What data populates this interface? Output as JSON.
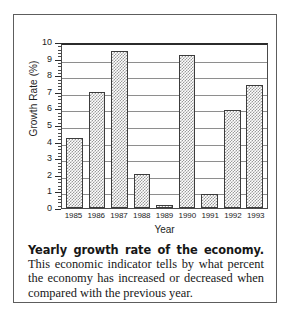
{
  "figure": {
    "caption_lead": "Yearly growth rate of the economy.",
    "caption_body": " This economic indicator tells by what percent the economy has increased or decreased when compared with the previous year."
  },
  "chart_data": {
    "type": "bar",
    "title": "",
    "xlabel": "Year",
    "ylabel": "Growth Rate (%)",
    "categories": [
      "1985",
      "1986",
      "1987",
      "1988",
      "1989",
      "1990",
      "1991",
      "1992",
      "1993"
    ],
    "values": [
      4.2,
      7.0,
      9.45,
      2.05,
      0.2,
      9.2,
      0.85,
      5.9,
      7.4
    ],
    "ylim": [
      0,
      10
    ],
    "ytick_labels": [
      "10",
      "9",
      "8",
      "7",
      "6",
      "5",
      "4",
      "3",
      "2",
      "1",
      "0"
    ],
    "ytick_values": [
      10,
      9,
      8,
      7,
      6,
      5,
      4,
      3,
      2,
      1,
      0
    ],
    "minor_tick_step": 0.2,
    "grid": "horizontal",
    "legend": "none",
    "bar_fill": "gray-checker-hatch",
    "bar_edge_color": "#3c3c3c",
    "grid_color": "#8e8e8e"
  }
}
